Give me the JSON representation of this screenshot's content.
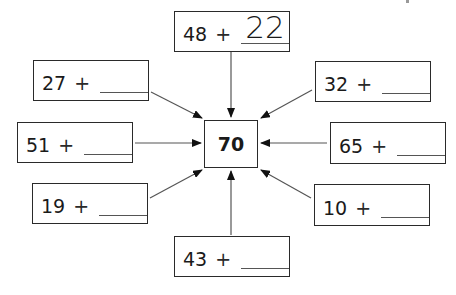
{
  "worksheet": {
    "target": "70",
    "problems": [
      {
        "id": "top",
        "addend": "48",
        "operator": "+",
        "answer": "22"
      },
      {
        "id": "upper-left",
        "addend": "27",
        "operator": "+",
        "answer": ""
      },
      {
        "id": "upper-right",
        "addend": "32",
        "operator": "+",
        "answer": ""
      },
      {
        "id": "left",
        "addend": "51",
        "operator": "+",
        "answer": ""
      },
      {
        "id": "right",
        "addend": "65",
        "operator": "+",
        "answer": ""
      },
      {
        "id": "lower-left",
        "addend": "19",
        "operator": "+",
        "answer": ""
      },
      {
        "id": "lower-right",
        "addend": "10",
        "operator": "+",
        "answer": ""
      },
      {
        "id": "bottom",
        "addend": "43",
        "operator": "+",
        "answer": ""
      }
    ]
  },
  "colors": {
    "line": "#2a2a2a",
    "arrow": "#555555",
    "background": "#ffffff"
  }
}
